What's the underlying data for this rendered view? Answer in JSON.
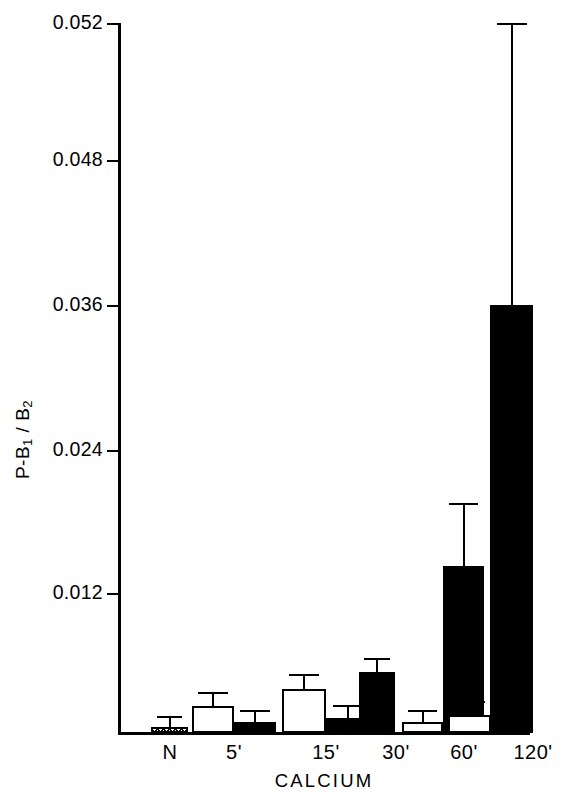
{
  "chart_data": {
    "type": "bar",
    "title": "",
    "xlabel": "CALCIUM",
    "ylabel": "P-B1 / B2",
    "ylabel_parts": {
      "prefix": "P-B",
      "sub1": "1",
      "mid": " / B",
      "sub2": "2"
    },
    "categories": [
      "N",
      "5'",
      "15'",
      "30'",
      "60'",
      "120'"
    ],
    "ytick_labels": [
      "0.052",
      "0.048",
      "0.036",
      "0.024",
      "0.012"
    ],
    "ytick_values": [
      0.052,
      0.048,
      0.036,
      0.024,
      0.012
    ],
    "ylim": [
      0,
      0.052
    ],
    "axis_note": "y-axis is broken/compressed between 0.048 and 0.052",
    "grid": "off",
    "legend": "none",
    "series": [
      {
        "name": "open",
        "fill": "white",
        "values": [
          null,
          0.0023,
          0.0037,
          null,
          0.0009,
          0.0015
        ],
        "errors": [
          null,
          0.0033,
          0.0048,
          null,
          0.0018,
          0.0025
        ]
      },
      {
        "name": "filled",
        "fill": "black",
        "values": [
          null,
          0.0009,
          0.0013,
          0.0051,
          0.014,
          0.0359
        ],
        "errors": [
          null,
          0.0018,
          0.0022,
          0.0061,
          0.0191,
          0.0605
        ]
      },
      {
        "name": "stippled",
        "fill": "stipple",
        "values": [
          0.0005,
          null,
          null,
          null,
          null,
          null
        ],
        "errors": [
          0.0013,
          null,
          null,
          null,
          null,
          null
        ]
      }
    ]
  },
  "bars": [
    {
      "name": "bar-N-stipple",
      "style": "stipple",
      "x": 30,
      "w": 37,
      "value": 0.0005,
      "error": 0.0013
    },
    {
      "name": "bar-5-open",
      "style": "open",
      "x": 71,
      "w": 42,
      "value": 0.0023,
      "error": 0.0033
    },
    {
      "name": "bar-5-filled",
      "style": "filled",
      "x": 113,
      "w": 42,
      "value": 0.0009,
      "error": 0.0018
    },
    {
      "name": "bar-15-open",
      "style": "open",
      "x": 161,
      "w": 44,
      "value": 0.0037,
      "error": 0.0048
    },
    {
      "name": "bar-15-filled",
      "style": "filled",
      "x": 205,
      "w": 44,
      "value": 0.0013,
      "error": 0.0022
    },
    {
      "name": "bar-30-filled",
      "style": "filled",
      "x": 238,
      "w": 36,
      "value": 0.0051,
      "error": 0.0061
    },
    {
      "name": "bar-60-open",
      "style": "open",
      "x": 281,
      "w": 41,
      "value": 0.0009,
      "error": 0.0018
    },
    {
      "name": "bar-60-filled",
      "style": "filled",
      "x": 322,
      "w": 41,
      "value": 0.014,
      "error": 0.0191
    },
    {
      "name": "bar-120-open",
      "style": "open",
      "x": 327,
      "w": 43,
      "value": 0.0015,
      "error": 0.0025
    },
    {
      "name": "bar-120-filled",
      "style": "filled",
      "x": 369,
      "w": 43,
      "value": 0.0359,
      "error": 0.0605
    }
  ],
  "xlabel_positions": [
    {
      "label": "N",
      "cx": 49
    },
    {
      "label": "5'",
      "cx": 113
    },
    {
      "label": "15'",
      "cx": 205
    },
    {
      "label": "30'",
      "cx": 275
    },
    {
      "label": "60'",
      "cx": 343
    },
    {
      "label": "120'",
      "cx": 412
    }
  ],
  "ytick_positions": [
    {
      "label": "0.052",
      "top": 23
    },
    {
      "label": "0.048",
      "top": 160
    },
    {
      "label": "0.036",
      "top": 305
    },
    {
      "label": "0.024",
      "top": 450
    },
    {
      "label": "0.012",
      "top": 593
    }
  ]
}
